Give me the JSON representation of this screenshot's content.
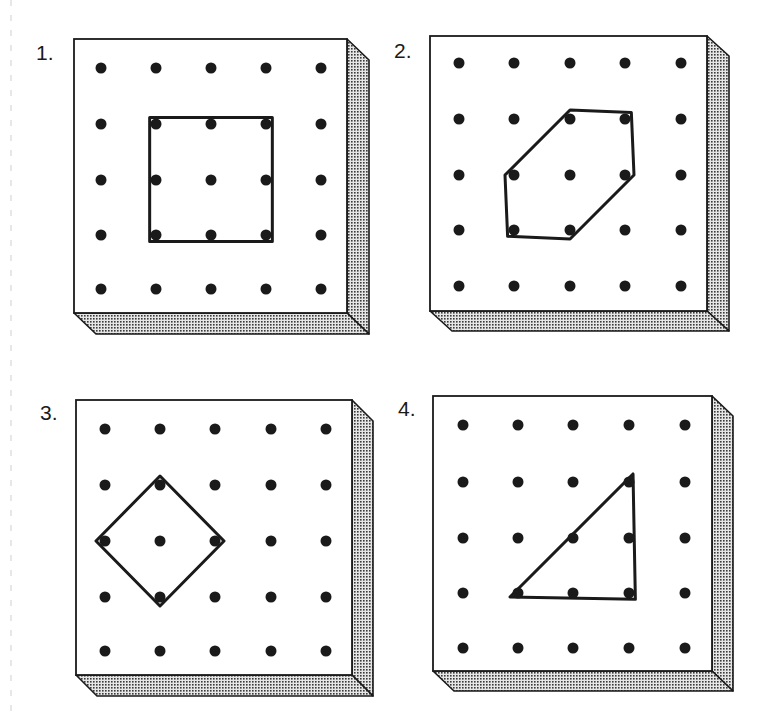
{
  "page": {
    "width": 771,
    "height": 720,
    "background": "#ffffff",
    "ink_color": "#1a1a1a",
    "side_fill": "#a8a8a8"
  },
  "margin_guide": {
    "x": 11,
    "y1": 0,
    "y2": 720,
    "dashed": true,
    "color": "#cfcfcf"
  },
  "boards": [
    {
      "label": "1.",
      "label_pos": [
        36,
        60
      ],
      "face": {
        "x": 74,
        "y": 39,
        "w": 273,
        "h": 274
      },
      "depth": {
        "dx": 22,
        "dy": 21
      },
      "cols": [
        101,
        156,
        211,
        266,
        321
      ],
      "rows": [
        68,
        124,
        180,
        235,
        289
      ],
      "shape_name": "square",
      "shape_pegs": [
        [
          1,
          1
        ],
        [
          3,
          1
        ],
        [
          3,
          3
        ],
        [
          1,
          3
        ]
      ]
    },
    {
      "label": "2.",
      "label_pos": [
        394,
        58
      ],
      "face": {
        "x": 430,
        "y": 36,
        "w": 277,
        "h": 275
      },
      "depth": {
        "dx": 22,
        "dy": 20
      },
      "cols": [
        459,
        514,
        570,
        625,
        681
      ],
      "rows": [
        63,
        119,
        175,
        230,
        286
      ],
      "shape_name": "hexagon",
      "shape_pegs": [
        [
          2,
          1
        ],
        [
          3,
          1
        ],
        [
          3,
          2
        ],
        [
          2,
          3
        ],
        [
          1,
          3
        ],
        [
          1,
          2
        ]
      ]
    },
    {
      "label": "3.",
      "label_pos": [
        40,
        420
      ],
      "face": {
        "x": 76,
        "y": 400,
        "w": 276,
        "h": 275
      },
      "depth": {
        "dx": 21,
        "dy": 21
      },
      "cols": [
        105,
        160,
        215,
        271,
        326
      ],
      "rows": [
        429,
        485,
        541,
        597,
        651
      ],
      "shape_name": "diamond",
      "shape_pegs": [
        [
          1,
          1
        ],
        [
          2,
          2
        ],
        [
          1,
          3
        ],
        [
          0,
          2
        ]
      ]
    },
    {
      "label": "4.",
      "label_pos": [
        398,
        416
      ],
      "face": {
        "x": 433,
        "y": 396,
        "w": 279,
        "h": 275
      },
      "depth": {
        "dx": 21,
        "dy": 20
      },
      "cols": [
        463,
        518,
        573,
        629,
        685
      ],
      "rows": [
        425,
        482,
        538,
        593,
        648
      ],
      "shape_name": "right-triangle",
      "shape_pegs": [
        [
          3,
          1
        ],
        [
          3,
          3
        ],
        [
          1,
          3
        ]
      ]
    }
  ]
}
